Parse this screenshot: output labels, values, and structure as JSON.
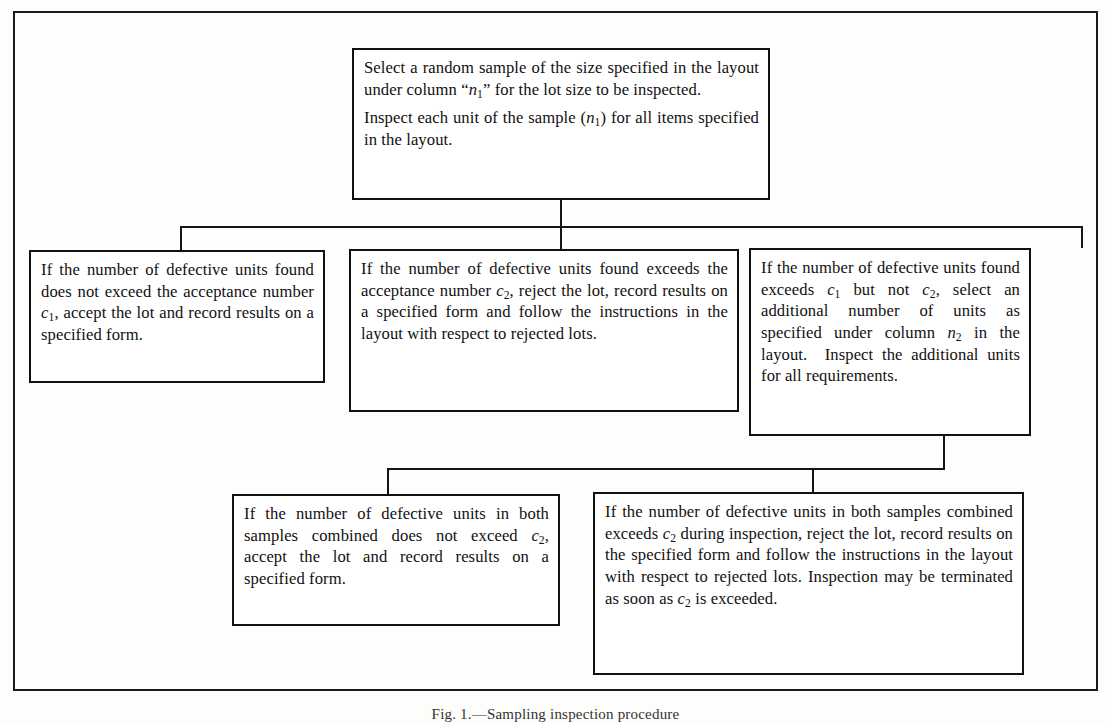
{
  "figure": {
    "kind": "flow-diagram",
    "title_caption": "Fig. 1.—Sampling inspection procedure",
    "frame_color": "#111111",
    "background_color": "#fdfdfb"
  },
  "nodes": {
    "root": {
      "name": "select-sample",
      "paragraphs": [
        "Select a random sample of the size speci­fied in the layout under column “n₁” for the lot size to be inspected.",
        "Inspect each unit of the sample (n₁) for all items specified in the layout."
      ]
    },
    "accept": {
      "name": "accept-lot",
      "text": "If the number of defective units found does not exceed the acceptance number c₁, accept the lot and record results on a specified form."
    },
    "reject": {
      "name": "reject-lot",
      "text": "If the number of defective units found exceeds the acceptance num­ber c₂, reject the lot, record results on a specified form and follow the in­structions in the layout with respect to rejected lots."
    },
    "resample": {
      "name": "second-sample",
      "text": "If the number of defective units found exceeds c₁ but not c₂, select an additional number of units as specified under column n₂ in the layout.  Inspect the additional units for all require­ments."
    },
    "accept2": {
      "name": "accept-lot-combined",
      "text": "If the number of defective units in both samples combined does not exceed c₂, accept the lot and record results on a specified form."
    },
    "reject2": {
      "name": "reject-lot-combined",
      "text": "If the number of defective units in both samples combined exceeds c₂ during inspec­tion, reject the lot, record results on the specified form and follow the instructions in the layout with respect to rejected lots.  Inspection may be terminated as soon as c₂ is exceeded."
    }
  },
  "symbols": {
    "n1": "n₁",
    "n2": "n₂",
    "c1": "c₁",
    "c2": "c₂"
  }
}
